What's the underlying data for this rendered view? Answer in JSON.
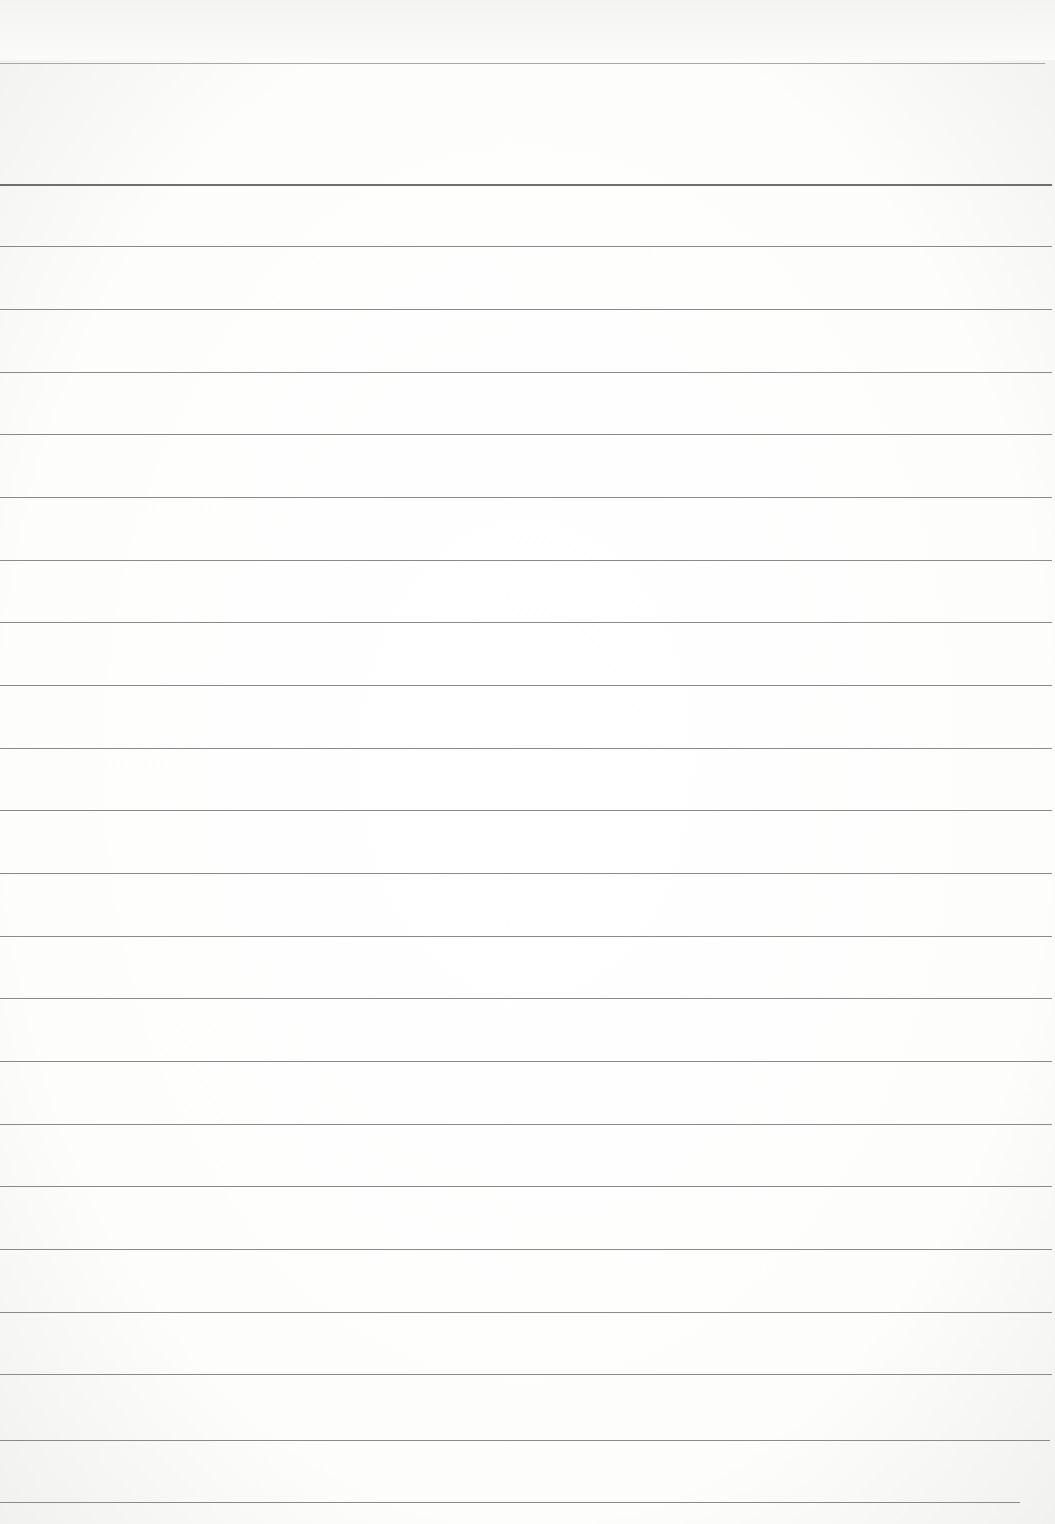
{
  "page": {
    "type": "ruled notebook page",
    "background_color": "#fbfbfa",
    "line_color": "#8a8a8a",
    "header_line": {
      "y": 63,
      "width": 1045
    },
    "top_margin_line": {
      "y": 184,
      "width": 1052
    },
    "ruled_lines": [
      {
        "y": 246,
        "width": 1052
      },
      {
        "y": 309,
        "width": 1052
      },
      {
        "y": 372,
        "width": 1052
      },
      {
        "y": 434,
        "width": 1052
      },
      {
        "y": 497,
        "width": 1052
      },
      {
        "y": 560,
        "width": 1052
      },
      {
        "y": 622,
        "width": 1052
      },
      {
        "y": 685,
        "width": 1052
      },
      {
        "y": 748,
        "width": 1052
      },
      {
        "y": 810,
        "width": 1052
      },
      {
        "y": 873,
        "width": 1052
      },
      {
        "y": 936,
        "width": 1052
      },
      {
        "y": 998,
        "width": 1052
      },
      {
        "y": 1061,
        "width": 1052
      },
      {
        "y": 1124,
        "width": 1052
      },
      {
        "y": 1186,
        "width": 1052
      },
      {
        "y": 1249,
        "width": 1052
      },
      {
        "y": 1312,
        "width": 1052
      },
      {
        "y": 1374,
        "width": 1052
      },
      {
        "y": 1440,
        "width": 1050
      },
      {
        "y": 1502,
        "width": 1020
      }
    ]
  }
}
